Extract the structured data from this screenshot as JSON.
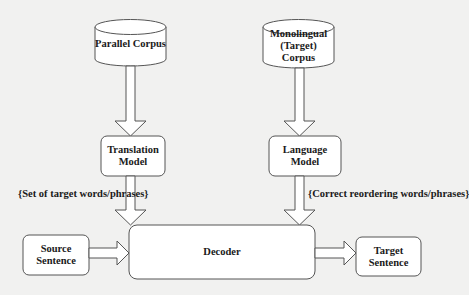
{
  "diagram": {
    "nodes": {
      "parallel_corpus": {
        "label": "Parallel Corpus",
        "shape": "cylinder"
      },
      "monolingual_corpus": {
        "label": "Monolingual (Target) Corpus",
        "line1": "Monolingual",
        "line2": "(Target) Corpus",
        "shape": "cylinder"
      },
      "translation_model": {
        "label": "Translation Model",
        "line1": "Translation",
        "line2": "Model",
        "shape": "rounded-rect"
      },
      "language_model": {
        "label": "Language Model",
        "shape": "rounded-rect"
      },
      "source_sentence": {
        "label": "Source Sentence",
        "shape": "rounded-rect"
      },
      "decoder": {
        "label": "Decoder",
        "shape": "rounded-rect"
      },
      "target_sentence": {
        "label": "Target Sentence",
        "shape": "rounded-rect"
      }
    },
    "edges": [
      {
        "from": "parallel_corpus",
        "to": "translation_model",
        "label": ""
      },
      {
        "from": "monolingual_corpus",
        "to": "language_model",
        "label": ""
      },
      {
        "from": "translation_model",
        "to": "decoder",
        "label": "{Set of target words/phrases}"
      },
      {
        "from": "language_model",
        "to": "decoder",
        "label": "{Correct reordering words/phrases}"
      },
      {
        "from": "source_sentence",
        "to": "decoder",
        "label": ""
      },
      {
        "from": "decoder",
        "to": "target_sentence",
        "label": ""
      }
    ],
    "edge_labels": {
      "tm_to_decoder": "{Set of target words/phrases}",
      "lm_to_decoder": "{Correct reordering words/phrases}"
    }
  },
  "colors": {
    "background": "#f1f1f0",
    "stroke": "#555555",
    "fill": "#ffffff",
    "text": "#1a1a1a"
  }
}
